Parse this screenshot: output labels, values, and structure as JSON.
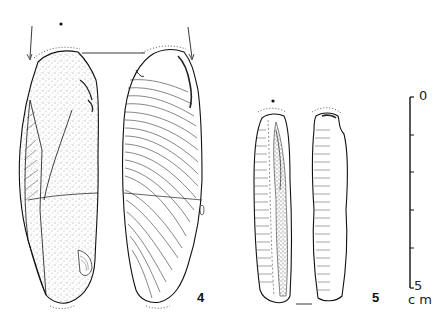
{
  "figure": {
    "type": "archaeological lithic illustration",
    "artifacts": [
      {
        "id": "4",
        "label": "4",
        "views": [
          "dorsal",
          "ventral"
        ]
      },
      {
        "id": "5",
        "label": "5",
        "views": [
          "dorsal",
          "ventral"
        ]
      }
    ],
    "scale": {
      "top_label": "0",
      "bottom_label": "5",
      "unit": "c m",
      "ticks": 6
    }
  },
  "colors": {
    "ink": "#111111",
    "background": "#ffffff"
  }
}
